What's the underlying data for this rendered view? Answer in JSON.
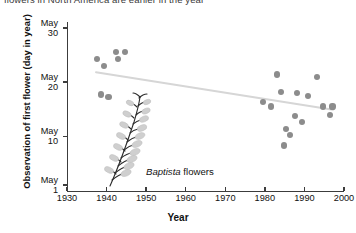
{
  "caption": {
    "text": "flowers in North America are earlier in the year"
  },
  "axes": {
    "y_title": "Observation of first flower (day in year)",
    "x_title": "Year",
    "y_ticks": [
      {
        "month": "May",
        "day": "30",
        "value": 30
      },
      {
        "month": "May",
        "day": "20",
        "value": 20
      },
      {
        "month": "May",
        "day": "10",
        "value": 10
      },
      {
        "month": "May",
        "day": "1",
        "value": 1
      }
    ],
    "x_ticks": [
      "1930",
      "1940",
      "1950",
      "1960",
      "1970",
      "1980",
      "1990",
      "2000"
    ]
  },
  "annotation": {
    "species": "Baptista",
    "suffix": " flowers",
    "icon": "flower-raceme-illustration"
  },
  "colors": {
    "dot": "#8c8c8c",
    "trend_line": "#d6d6d6",
    "axis": "#3c3c3c",
    "text": "#111111"
  },
  "chart_data": {
    "type": "scatter",
    "title": "",
    "xlabel": "Year",
    "ylabel": "Observation of first flower (day in year)",
    "xlim": [
      1930,
      2000
    ],
    "ylim": [
      1,
      31
    ],
    "grid": false,
    "legend": null,
    "y_tick_values": [
      30,
      20,
      10,
      1
    ],
    "y_tick_labels": [
      "May 30",
      "May 20",
      "May 10",
      "May 1"
    ],
    "x_tick_values": [
      1930,
      1940,
      1950,
      1960,
      1970,
      1980,
      1990,
      2000
    ],
    "points": [
      {
        "x": 1937.5,
        "y": 24.3
      },
      {
        "x": 1939.3,
        "y": 23.0
      },
      {
        "x": 1938.6,
        "y": 17.7
      },
      {
        "x": 1940.5,
        "y": 17.2
      },
      {
        "x": 1942.3,
        "y": 25.6
      },
      {
        "x": 1942.9,
        "y": 24.2
      },
      {
        "x": 1944.7,
        "y": 25.5
      },
      {
        "x": 1979.6,
        "y": 16.3
      },
      {
        "x": 1981.5,
        "y": 15.5
      },
      {
        "x": 1983.1,
        "y": 21.4
      },
      {
        "x": 1984.0,
        "y": 18.2
      },
      {
        "x": 1984.9,
        "y": 8.3
      },
      {
        "x": 1985.4,
        "y": 11.3
      },
      {
        "x": 1986.3,
        "y": 10.3
      },
      {
        "x": 1987.6,
        "y": 13.7
      },
      {
        "x": 1988.2,
        "y": 18.0
      },
      {
        "x": 1989.4,
        "y": 12.6
      },
      {
        "x": 1990.8,
        "y": 17.4
      },
      {
        "x": 1993.2,
        "y": 21.0
      },
      {
        "x": 1994.6,
        "y": 15.5
      },
      {
        "x": 1996.4,
        "y": 13.9
      },
      {
        "x": 1997.1,
        "y": 15.5
      }
    ],
    "trend_line": {
      "name": "linear fit",
      "x_start": 1937.0,
      "y_start": 21.9,
      "x_end": 1997.5,
      "y_end": 14.9
    }
  }
}
